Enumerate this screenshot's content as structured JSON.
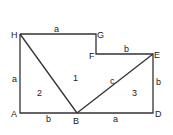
{
  "diagram": {
    "vertices": {
      "H": {
        "label": "H",
        "x": 20,
        "y": 34
      },
      "G": {
        "label": "G",
        "x": 96,
        "y": 34
      },
      "F": {
        "label": "F",
        "x": 96,
        "y": 54
      },
      "E": {
        "label": "E",
        "x": 153,
        "y": 54
      },
      "D": {
        "label": "D",
        "x": 153,
        "y": 113
      },
      "B": {
        "label": "B",
        "x": 77,
        "y": 113
      },
      "A": {
        "label": "A",
        "x": 20,
        "y": 113
      }
    },
    "edge_labels": {
      "HG": "a",
      "FE": "b",
      "ED": "b",
      "BD": "a",
      "AB": "b",
      "HA": "a",
      "BE": "c"
    },
    "regions": [
      "1",
      "2",
      "3"
    ],
    "colors": {
      "stroke": "#333333",
      "text": "#222222",
      "background": "#ffffff"
    }
  }
}
